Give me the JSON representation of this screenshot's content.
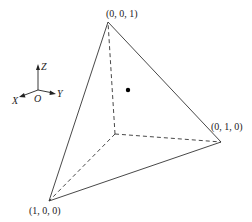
{
  "diagram": {
    "type": "3d-simplex-tetrahedron",
    "colors": {
      "stroke": "#333333",
      "dot": "#000000",
      "background": "#ffffff"
    },
    "vertices": {
      "z_vertex": {
        "label": "(0, 0, 1)",
        "x": 108,
        "y": 22
      },
      "y_vertex": {
        "label": "(0, 1, 0)",
        "x": 221,
        "y": 142
      },
      "x_vertex": {
        "label": "(1, 0, 0)",
        "x": 49,
        "y": 201
      },
      "origin_vertex": {
        "x": 115,
        "y": 134
      }
    },
    "point": {
      "x": 128,
      "y": 90
    },
    "axes": {
      "origin_label": "O",
      "x_label": "X",
      "y_label": "Y",
      "z_label": "Z"
    }
  }
}
